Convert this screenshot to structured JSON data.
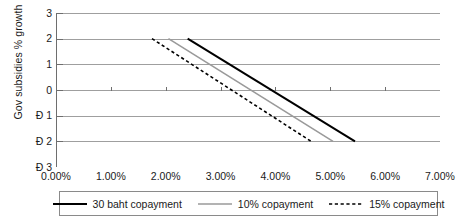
{
  "chart_data": {
    "type": "line",
    "title": "",
    "subtitle": "",
    "xlabel": "",
    "ylabel": "Gov subsidies % growth",
    "xlim": [
      0.0,
      7.0
    ],
    "ylim": [
      -3,
      3
    ],
    "x_tick_labels": [
      "0.00%",
      "1.00%",
      "2.00%",
      "3.00%",
      "4.00%",
      "5.00%",
      "6.00%",
      "7.00%"
    ],
    "x_tick_values": [
      0.0,
      1.0,
      2.0,
      3.0,
      4.0,
      5.0,
      6.0,
      7.0
    ],
    "y_tick_labels": [
      "3",
      "2",
      "1",
      "0",
      "Ð 1",
      "Ð 2",
      "Ð 3"
    ],
    "y_tick_values": [
      3,
      2,
      1,
      0,
      -1,
      -2,
      -3
    ],
    "grid": true,
    "grid_axis": "y",
    "legend_position": "bottom",
    "series": [
      {
        "name": "30 baht copayment",
        "style": "solid",
        "color": "#000000",
        "width": 2.0,
        "points": [
          [
            2.4,
            2
          ],
          [
            5.45,
            -2
          ]
        ]
      },
      {
        "name": "10% copayment",
        "style": "solid",
        "color": "#9a9a9a",
        "width": 1.6,
        "points": [
          [
            2.05,
            2
          ],
          [
            5.05,
            -2
          ]
        ]
      },
      {
        "name": "15% copayment",
        "style": "dashed",
        "color": "#000000",
        "width": 1.6,
        "points": [
          [
            1.75,
            2
          ],
          [
            4.65,
            -2
          ]
        ]
      }
    ]
  },
  "legend": {
    "items": [
      {
        "label": "30 baht copayment"
      },
      {
        "label": "10% copayment"
      },
      {
        "label": "15% copayment"
      }
    ]
  },
  "colors": {
    "axis": "#6e6e6e",
    "grid": "#9f9f9f",
    "text": "#1a1a1a",
    "series_solid_black": "#000000",
    "series_gray": "#9a9a9a",
    "legend_border": "#8a8a8a",
    "background": "#ffffff"
  }
}
